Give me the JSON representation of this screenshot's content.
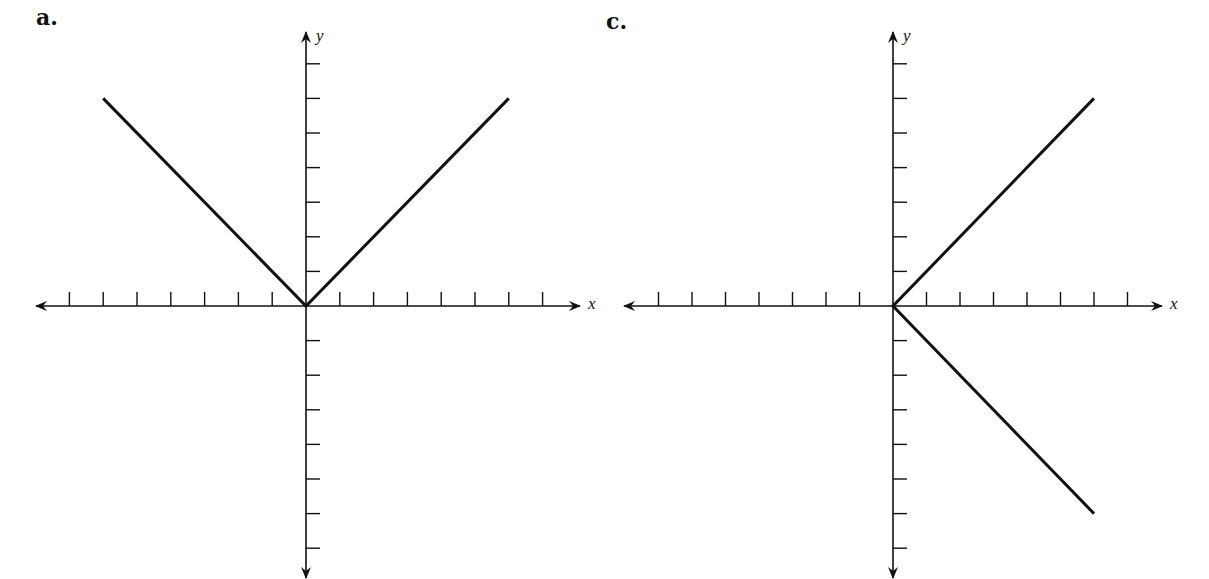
{
  "chart_data": [
    {
      "type": "line",
      "panel": "a.",
      "title": "",
      "xlabel": "x",
      "ylabel": "y",
      "x_ticks": [
        -7,
        -6,
        -5,
        -4,
        -3,
        -2,
        -1,
        1,
        2,
        3,
        4,
        5,
        6,
        7
      ],
      "y_ticks": [
        -7,
        -6,
        -5,
        -4,
        -3,
        -2,
        -1,
        1,
        2,
        3,
        4,
        5,
        6,
        7
      ],
      "xlim": [
        -8,
        8
      ],
      "ylim": [
        -8,
        8
      ],
      "grid": false,
      "tick_labels_shown": false,
      "series": [
        {
          "name": "graph",
          "points": [
            [
              -6,
              6
            ],
            [
              0,
              0
            ],
            [
              6,
              6
            ]
          ]
        }
      ],
      "description": "V-shaped graph y = |x| from x = -6 to 6"
    },
    {
      "type": "line",
      "panel": "c.",
      "title": "",
      "xlabel": "x",
      "ylabel": "y",
      "x_ticks": [
        -7,
        -6,
        -5,
        -4,
        -3,
        -2,
        -1,
        1,
        2,
        3,
        4,
        5,
        6,
        7
      ],
      "y_ticks": [
        -7,
        -6,
        -5,
        -4,
        -3,
        -2,
        -1,
        1,
        2,
        3,
        4,
        5,
        6,
        7
      ],
      "xlim": [
        -8,
        8
      ],
      "ylim": [
        -8,
        8
      ],
      "grid": false,
      "tick_labels_shown": false,
      "series": [
        {
          "name": "graph",
          "points": [
            [
              6,
              6
            ],
            [
              0,
              0
            ],
            [
              6,
              -6
            ]
          ]
        }
      ],
      "description": "Sideways V opening right: x = |y| from y = -6 to 6"
    }
  ],
  "panels": [
    {
      "label": "a.",
      "x_axis_label": "x",
      "y_axis_label": "y"
    },
    {
      "label": "c.",
      "x_axis_label": "x",
      "y_axis_label": "y"
    }
  ],
  "style": {
    "ink": "#111111",
    "background": "#ffffff"
  }
}
